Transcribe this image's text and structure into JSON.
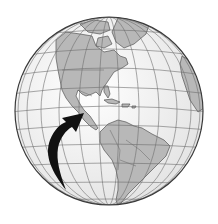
{
  "figure": {
    "subject": "Globe of the Western Hemisphere with an arrow pointing to Central America",
    "arrow_target": "Central America"
  },
  "colors": {
    "background": "#ffffff",
    "ocean": "#f2f2f2",
    "land": "#b8b8b8",
    "coast": "#555555",
    "grid": "#6e6e6e",
    "outline": "#3a3a3a",
    "arrow": "#111111"
  },
  "globe": {
    "cx": 109,
    "cy": 111,
    "r": 94
  }
}
